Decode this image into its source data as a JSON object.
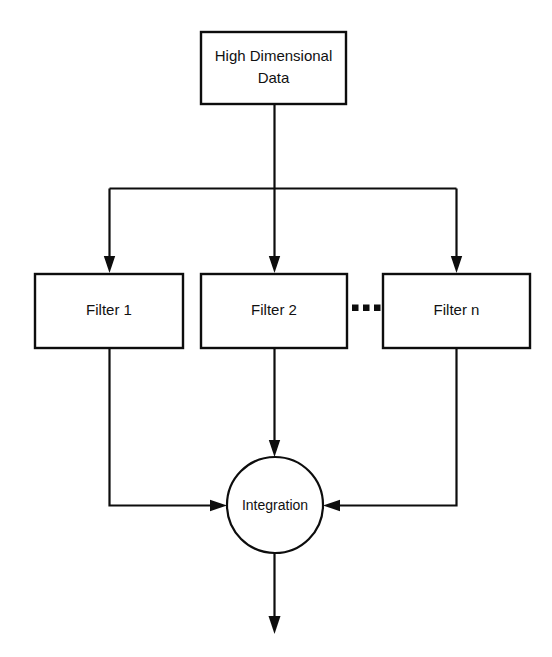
{
  "diagram": {
    "type": "flowchart",
    "background_color": "#ffffff",
    "line_color": "#0d0d0d",
    "text_color": "#111111",
    "nodes": {
      "source": {
        "id": "high-dimensional-data",
        "shape": "rectangle",
        "label_line_1": "High Dimensional",
        "label_line_2": "Data"
      },
      "filter_1": {
        "id": "filter-1",
        "shape": "rectangle",
        "label": "Filter 1"
      },
      "filter_2": {
        "id": "filter-2",
        "shape": "rectangle",
        "label": "Filter 2"
      },
      "filter_n": {
        "id": "filter-n",
        "shape": "rectangle",
        "label": "Filter n"
      },
      "integration": {
        "id": "integration",
        "shape": "circle",
        "label": "Integration"
      }
    },
    "ellipsis": {
      "id": "filter-ellipsis",
      "label": "...",
      "dot_count": 3,
      "meaning": "additional filters between Filter 2 and Filter n"
    },
    "edges": [
      {
        "id": "edge-source-to-filter-1",
        "from": "high-dimensional-data",
        "to": "filter-1",
        "arrow": true
      },
      {
        "id": "edge-source-to-filter-2",
        "from": "high-dimensional-data",
        "to": "filter-2",
        "arrow": true
      },
      {
        "id": "edge-source-to-filter-n",
        "from": "high-dimensional-data",
        "to": "filter-n",
        "arrow": true
      },
      {
        "id": "edge-filter-1-to-integration",
        "from": "filter-1",
        "to": "integration",
        "arrow": true
      },
      {
        "id": "edge-filter-2-to-integration",
        "from": "filter-2",
        "to": "integration",
        "arrow": true
      },
      {
        "id": "edge-filter-n-to-integration",
        "from": "filter-n",
        "to": "integration",
        "arrow": true
      },
      {
        "id": "edge-integration-output",
        "from": "integration",
        "to": "output",
        "arrow": true
      }
    ]
  }
}
